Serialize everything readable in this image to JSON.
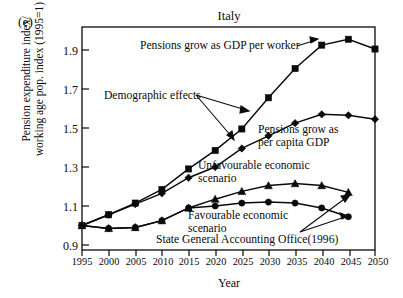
{
  "figure": {
    "panel_label": "(e)",
    "title": "Italy",
    "xlabel": "Year",
    "ylabel": "Pension expenditure index/\nworking age pop. index (1995=1)"
  },
  "axis": {
    "y_ticks": [
      "0.9",
      "1.1",
      "1.3",
      "1.5",
      "1.7",
      "1.9"
    ],
    "x_ticks": [
      "1995",
      "2000",
      "2005",
      "2010",
      "2015",
      "2020",
      "2025",
      "2030",
      "2035",
      "2040",
      "2045",
      "2050"
    ]
  },
  "annotations": {
    "gdp_per_worker": "Pensions grow as GDP per worker",
    "demographic_effects": "Demographic effects",
    "per_capita_gdp": "Pensions grow as\nper capita GDP",
    "unfavourable": "Unfavourable economic\nscenario",
    "favourable": "Favourable economic\nscenario",
    "source": "State General Accounting Office(1996)"
  },
  "colors": {
    "ink": "#0a0a0a",
    "background": "#ffffff"
  },
  "chart_data": {
    "type": "line",
    "title": "Italy",
    "xlabel": "Year",
    "ylabel": "Pension expenditure index/working age pop. index (1995=1)",
    "xlim": [
      1995,
      2050
    ],
    "ylim": [
      0.9,
      1.98
    ],
    "grid": false,
    "legend": "none (inline annotations)",
    "x": [
      1995,
      2000,
      2005,
      2010,
      2015,
      2020,
      2025,
      2030,
      2035,
      2040,
      2045,
      2050
    ],
    "series": [
      {
        "name": "Pensions grow as GDP per worker",
        "marker": "square",
        "values": [
          1.0,
          1.055,
          1.115,
          1.185,
          1.29,
          1.385,
          1.495,
          1.655,
          1.805,
          1.925,
          1.955,
          1.905
        ]
      },
      {
        "name": "Pensions grow as per capita GDP",
        "marker": "diamond",
        "values": [
          1.0,
          1.055,
          1.11,
          1.165,
          1.245,
          1.3,
          1.395,
          1.46,
          1.525,
          1.57,
          1.565,
          1.545
        ]
      },
      {
        "name": "Unfavourable economic scenario",
        "marker": "triangle",
        "values": [
          1.0,
          0.985,
          0.99,
          1.025,
          1.09,
          1.135,
          1.175,
          1.205,
          1.215,
          1.205,
          1.17,
          null
        ]
      },
      {
        "name": "Favourable economic scenario",
        "marker": "circle",
        "values": [
          1.0,
          0.985,
          0.99,
          1.025,
          1.09,
          1.1,
          1.115,
          1.12,
          1.115,
          1.09,
          1.045,
          null
        ]
      }
    ]
  }
}
